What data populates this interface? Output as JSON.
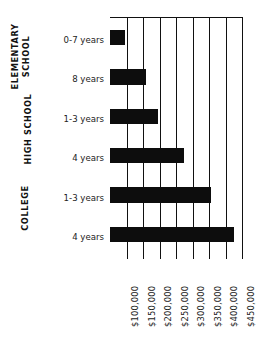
{
  "chart_data": {
    "type": "bar",
    "orientation": "horizontal",
    "title": "",
    "subtitle": "",
    "xlabel": "",
    "ylabel": "",
    "categories": [
      "0-7 years",
      "8 years",
      "1-3 years",
      "4 years",
      "1-3 years",
      "4 years"
    ],
    "values": [
      95000,
      160000,
      195000,
      275000,
      355000,
      425000
    ],
    "groups": [
      {
        "name": "ELEMENTARY SCHOOL",
        "categories": [
          "0-7 years",
          "8 years"
        ]
      },
      {
        "name": "HIGH SCHOOL",
        "categories": [
          "1-3 years",
          "4 years"
        ]
      },
      {
        "name": "COLLEGE",
        "categories": [
          "1-3 years",
          "4 years"
        ]
      }
    ],
    "xticks": [
      "$100,000",
      "$150,000",
      "$200,000",
      "$250,000",
      "$300,000",
      "$350,000",
      "$400,000",
      "$450,000"
    ],
    "xtick_values": [
      100000,
      150000,
      200000,
      250000,
      300000,
      350000,
      400000,
      450000
    ],
    "xlim": [
      50000,
      450000
    ],
    "grid": true,
    "legend": false,
    "bar_color": "#0d0d0d",
    "axis_color": "#111111"
  },
  "group_labels": {
    "elementary_line1": "ELEMENTARY",
    "elementary_line2": "SCHOOL",
    "high_school": "HIGH SCHOOL",
    "college": "COLLEGE"
  },
  "category_labels": {
    "c0": "0-7 years",
    "c1": "8 years",
    "c2": "1-3 years",
    "c3": "4 years",
    "c4": "1-3 years",
    "c5": "4 years"
  },
  "xtick_labels": {
    "t0": "$100,000",
    "t1": "$150,000",
    "t2": "$200,000",
    "t3": "$250,000",
    "t4": "$300,000",
    "t5": "$350,000",
    "t6": "$400,000",
    "t7": "$450,000"
  }
}
